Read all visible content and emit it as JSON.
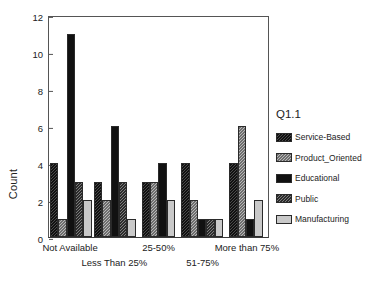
{
  "chart_data": {
    "type": "bar",
    "title": "",
    "xlabel": "",
    "ylabel": "Count",
    "ylim": [
      0,
      12
    ],
    "yticks": [
      0,
      2,
      4,
      6,
      8,
      10,
      12
    ],
    "grid": false,
    "legend_position": "right",
    "legend_title": "Q1.1",
    "categories": [
      "Not Available",
      "Less Than 25%",
      "25-50%",
      "51-75%",
      "More than 75%"
    ],
    "series": [
      {
        "name": "Service-Based",
        "values": [
          4,
          3,
          3,
          4,
          4
        ],
        "color": "#4a4a4a"
      },
      {
        "name": "Product_Oriented",
        "values": [
          1,
          2,
          3,
          2,
          6
        ],
        "color": "#b8b8b8"
      },
      {
        "name": "Educational",
        "values": [
          11,
          6,
          4,
          1,
          1
        ],
        "color": "#111111"
      },
      {
        "name": "Public",
        "values": [
          3,
          3,
          0,
          1,
          0
        ],
        "color": "#7d7d7d"
      },
      {
        "name": "Manufacturing",
        "values": [
          2,
          1,
          2,
          1,
          2
        ],
        "color": "#c9c9c9"
      }
    ]
  }
}
